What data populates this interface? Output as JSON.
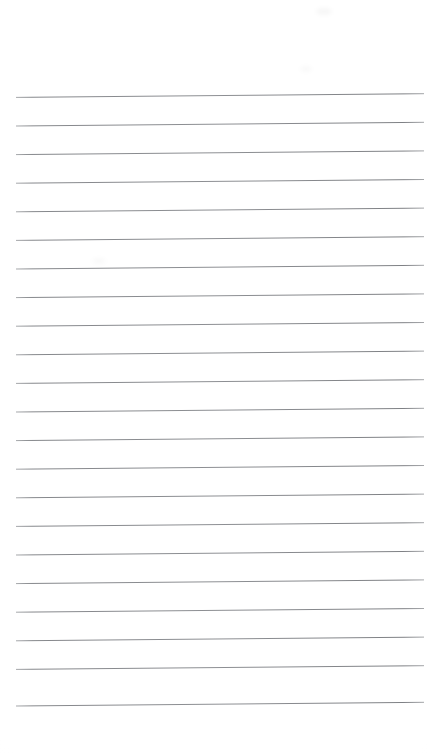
{
  "page": {
    "kind": "blank-ruled-page",
    "width_px": 428,
    "height_px": 754,
    "background_color": "#ffffff",
    "content_text": "",
    "status_note": ""
  },
  "ruling": {
    "line_color": "#8d8f93",
    "line_color_light": "#b9bbbe",
    "line_thickness_px": 1,
    "line_count": 22,
    "first_line_y": 96,
    "line_spacing_px": 28.6,
    "left_x": 16,
    "right_x": 424,
    "tilt_degrees": -0.52,
    "margins": {
      "top_px": 96,
      "bottom_px": 48,
      "left_px": 16,
      "right_px": 4
    },
    "lines": [
      {
        "index": 1,
        "y_left": 97.4,
        "y_right": 93.7
      },
      {
        "index": 2,
        "y_left": 126.0,
        "y_right": 122.3
      },
      {
        "index": 3,
        "y_left": 154.6,
        "y_right": 150.9
      },
      {
        "index": 4,
        "y_left": 183.2,
        "y_right": 179.5
      },
      {
        "index": 5,
        "y_left": 211.8,
        "y_right": 208.1
      },
      {
        "index": 6,
        "y_left": 240.4,
        "y_right": 236.7
      },
      {
        "index": 7,
        "y_left": 269.0,
        "y_right": 265.3
      },
      {
        "index": 8,
        "y_left": 297.6,
        "y_right": 293.9
      },
      {
        "index": 9,
        "y_left": 326.2,
        "y_right": 322.5
      },
      {
        "index": 10,
        "y_left": 354.8,
        "y_right": 351.1
      },
      {
        "index": 11,
        "y_left": 383.4,
        "y_right": 379.7
      },
      {
        "index": 12,
        "y_left": 412.0,
        "y_right": 408.3
      },
      {
        "index": 13,
        "y_left": 440.6,
        "y_right": 436.9
      },
      {
        "index": 14,
        "y_left": 469.2,
        "y_right": 465.5
      },
      {
        "index": 15,
        "y_left": 497.8,
        "y_right": 494.1
      },
      {
        "index": 16,
        "y_left": 526.4,
        "y_right": 522.7
      },
      {
        "index": 17,
        "y_left": 555.0,
        "y_right": 551.3
      },
      {
        "index": 18,
        "y_left": 583.6,
        "y_right": 579.9
      },
      {
        "index": 19,
        "y_left": 612.2,
        "y_right": 608.5
      },
      {
        "index": 20,
        "y_left": 640.8,
        "y_right": 637.1
      },
      {
        "index": 21,
        "y_left": 669.4,
        "y_right": 665.7
      },
      {
        "index": 22,
        "y_left": 706.0,
        "y_right": 702.3
      }
    ]
  },
  "artifacts": {
    "smudges": [
      {
        "name": "smudge-top-right",
        "x": 316,
        "y": 8,
        "w": 16,
        "h": 7
      },
      {
        "name": "smudge-mid-right",
        "x": 300,
        "y": 66,
        "w": 12,
        "h": 6
      },
      {
        "name": "smudge-mid-left",
        "x": 92,
        "y": 258,
        "w": 14,
        "h": 6
      }
    ]
  }
}
